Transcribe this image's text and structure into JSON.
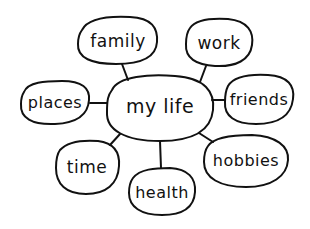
{
  "diagram": {
    "type": "mind-map",
    "style": "hand-drawn",
    "colors": {
      "stroke": "#111111",
      "background": "#ffffff"
    },
    "center": {
      "id": "my-life",
      "label": "my life"
    },
    "branches": [
      {
        "id": "family",
        "label": "family"
      },
      {
        "id": "work",
        "label": "work"
      },
      {
        "id": "places",
        "label": "places"
      },
      {
        "id": "friends",
        "label": "friends"
      },
      {
        "id": "time",
        "label": "time"
      },
      {
        "id": "health",
        "label": "health"
      },
      {
        "id": "hobbies",
        "label": "hobbies"
      }
    ],
    "edges": [
      [
        "my-life",
        "family"
      ],
      [
        "my-life",
        "work"
      ],
      [
        "my-life",
        "places"
      ],
      [
        "my-life",
        "friends"
      ],
      [
        "my-life",
        "time"
      ],
      [
        "my-life",
        "health"
      ],
      [
        "my-life",
        "hobbies"
      ]
    ]
  }
}
